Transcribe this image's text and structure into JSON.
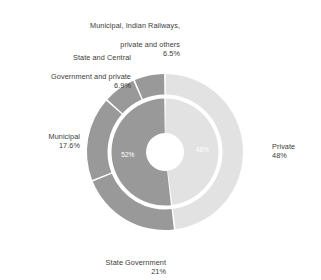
{
  "chart_data": {
    "type": "pie",
    "title": "",
    "subtitle": "",
    "xlabel": "",
    "ylabel": "",
    "legend_position": "none",
    "grid": false,
    "variant": "nested-donut",
    "rings": [
      {
        "name": "inner",
        "description": "Public vs private split",
        "segments": [
          {
            "label": "",
            "value": 52,
            "value_label": "52%",
            "color": "#999999",
            "label_position": "inside"
          },
          {
            "label": "",
            "value": 48,
            "value_label": "48%",
            "color": "#e2e2e2",
            "label_position": "inside"
          }
        ]
      },
      {
        "name": "outer",
        "description": "Ownership breakdown",
        "segments": [
          {
            "label": "Private",
            "value": 48,
            "value_label": "48%",
            "color": "#e2e2e2",
            "label_position": "right"
          },
          {
            "label": "State Government",
            "value": 21,
            "value_label": "21%",
            "color": "#999999",
            "label_position": "bottom"
          },
          {
            "label": "Municipal",
            "value": 17.6,
            "value_label": "17.6%",
            "color": "#999999",
            "label_position": "left"
          },
          {
            "label": "State and Central Government and private",
            "value": 6.9,
            "value_label": "6.9%",
            "color": "#999999",
            "label_position": "upper-left"
          },
          {
            "label": "Municipal, Indian Railways, private and others",
            "value": 6.5,
            "value_label": "6.5%",
            "color": "#999999",
            "label_position": "top"
          }
        ]
      }
    ],
    "colors": {
      "light_gray": "#e2e2e2",
      "dark_gray": "#999999",
      "separator": "#ffffff",
      "text": "#3c3c3c",
      "background": "#ffffff"
    }
  },
  "labels": {
    "railways": {
      "line1": "Municipal, Indian Railways,",
      "line2": "private and others",
      "pct": "6.5%"
    },
    "state_central": {
      "line1": "State and Central",
      "line2": "Government and private",
      "pct": "6.9%"
    },
    "municipal": {
      "line1": "Municipal",
      "pct": "17.6%"
    },
    "state_gov": {
      "line1": "State Government",
      "pct": "21%"
    },
    "private": {
      "line1": "Private",
      "pct": "48%"
    }
  },
  "inner_labels": {
    "public": "52%",
    "private": "48%"
  }
}
